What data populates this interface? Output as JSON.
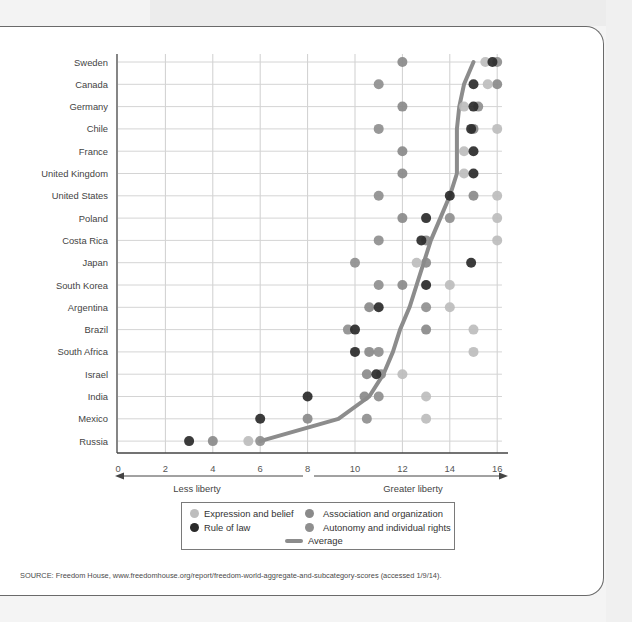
{
  "chart_data": {
    "type": "scatter",
    "title": "",
    "xlabel": "",
    "ylabel": "",
    "xlim": [
      0,
      16.5
    ],
    "xticks": [
      0,
      2,
      4,
      6,
      8,
      10,
      12,
      14,
      16
    ],
    "grid": true,
    "legend_position": "bottom",
    "categories": [
      "Sweden",
      "Canada",
      "Germany",
      "Chile",
      "France",
      "United Kingdom",
      "United States",
      "Poland",
      "Costa Rica",
      "Japan",
      "South Korea",
      "Argentina",
      "Brazil",
      "South Africa",
      "Israel",
      "India",
      "Mexico",
      "Russia"
    ],
    "series": [
      {
        "name": "Expression and belief",
        "color": "#bdbdbd",
        "values": [
          15.5,
          15.6,
          14.6,
          16,
          14.6,
          14.6,
          16,
          16,
          16,
          12.6,
          14,
          14,
          15,
          15,
          12,
          13,
          13,
          5.5
        ]
      },
      {
        "name": "Rule of law",
        "color": "#2a2a2a",
        "values": [
          15.8,
          15,
          15,
          14.9,
          15,
          15,
          14,
          13,
          12.8,
          14.9,
          13,
          11,
          10,
          10,
          10.9,
          8,
          6,
          3
        ]
      },
      {
        "name": "Association and organization",
        "color": "#8a8a8a",
        "values": [
          12,
          16,
          12,
          15,
          12,
          12,
          15,
          12,
          13,
          13,
          12,
          10.6,
          13,
          10.6,
          10.5,
          10.4,
          8,
          4
        ]
      },
      {
        "name": "Autonomy and individual rights",
        "color": "#8f8f8f",
        "values": [
          16,
          11,
          15.2,
          11,
          null,
          null,
          11,
          14,
          11,
          10,
          11,
          13,
          9.7,
          11,
          11.1,
          11,
          10.5,
          6
        ]
      },
      {
        "name": "Average",
        "type": "line",
        "color": "#8c8c8c",
        "values": [
          15,
          14.6,
          14.4,
          14.3,
          14.3,
          14.3,
          14,
          13.6,
          13.2,
          12.9,
          12.6,
          12.3,
          11.9,
          11.6,
          11.2,
          10.6,
          9.3,
          6
        ]
      }
    ],
    "axis_arrows": {
      "left_label": "Less liberty",
      "right_label": "Greater liberty"
    },
    "source": "SOURCE: Freedom House, www.freedomhouse.org/report/freedom-world-aggregate-and-subcategory-scores (accessed 1/9/14)."
  },
  "legend": {
    "expression": "Expression and belief",
    "association": "Association and organization",
    "rule": "Rule of law",
    "autonomy": "Autonomy and individual rights",
    "average": "Average"
  },
  "axis": {
    "less": "Less liberty",
    "greater": "Greater liberty"
  },
  "source": "SOURCE: Freedom House, www.freedomhouse.org/report/freedom-world-aggregate-and-subcategory-scores (accessed 1/9/14)."
}
